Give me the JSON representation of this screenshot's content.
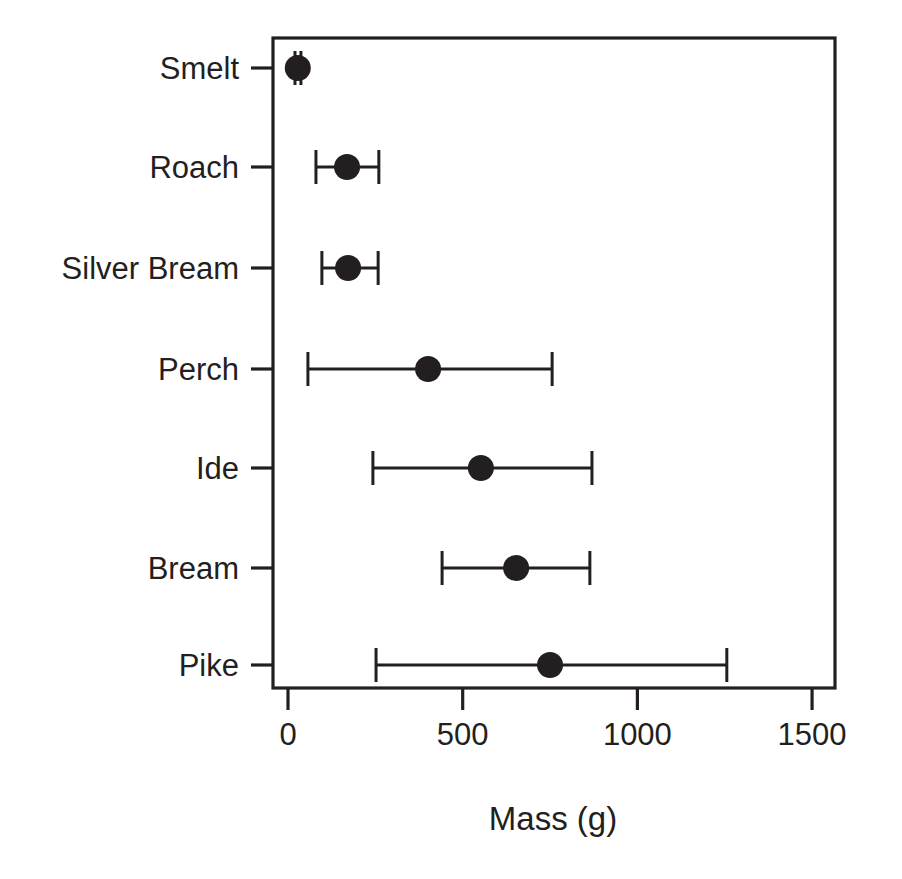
{
  "chart_data": {
    "type": "scatter",
    "title": "",
    "subtitle": "",
    "xlabel": "Mass (g)",
    "ylabel": "",
    "orientation": "horizontal",
    "grid": false,
    "legend": null,
    "xlim": [
      -40,
      1560
    ],
    "xticks": [
      0,
      500,
      1000,
      1500
    ],
    "xticklabels": [
      "0",
      "500",
      "1000",
      "1500"
    ],
    "categories": [
      "Smelt",
      "Roach",
      "Silver Bream",
      "Perch",
      "Ide",
      "Bream",
      "Pike"
    ],
    "series": [
      {
        "name": "Mean mass with error bars",
        "marker": "filled-circle",
        "color": "#231f20",
        "points": [
          {
            "category": "Smelt",
            "value": 28,
            "lower": 20,
            "upper": 37
          },
          {
            "category": "Roach",
            "value": 169,
            "lower": 80,
            "upper": 260
          },
          {
            "category": "Silver Bream",
            "value": 172,
            "lower": 97,
            "upper": 258
          },
          {
            "category": "Perch",
            "value": 401,
            "lower": 57,
            "upper": 756
          },
          {
            "category": "Ide",
            "value": 552,
            "lower": 243,
            "upper": 870
          },
          {
            "category": "Bream",
            "value": 653,
            "lower": 441,
            "upper": 864
          },
          {
            "category": "Pike",
            "value": 750,
            "lower": 252,
            "upper": 1256
          }
        ]
      }
    ],
    "annotations": []
  },
  "geometry": {
    "plot_left_px": 273,
    "plot_right_px": 835,
    "plot_top_px": 38,
    "plot_bottom_px": 688,
    "x0_px": 288,
    "px_per_unit": 0.34938,
    "row_y_px": [
      68,
      167,
      268,
      369,
      468,
      568,
      665
    ],
    "marker_radius_px": 13,
    "cap_half_height_px": 17,
    "xtick_label_y_px": 745,
    "xaxis_title_xy_px": [
      553,
      830
    ]
  },
  "colors": {
    "background": "#ffffff",
    "foreground": "#231f20",
    "marker": "#231f20"
  }
}
